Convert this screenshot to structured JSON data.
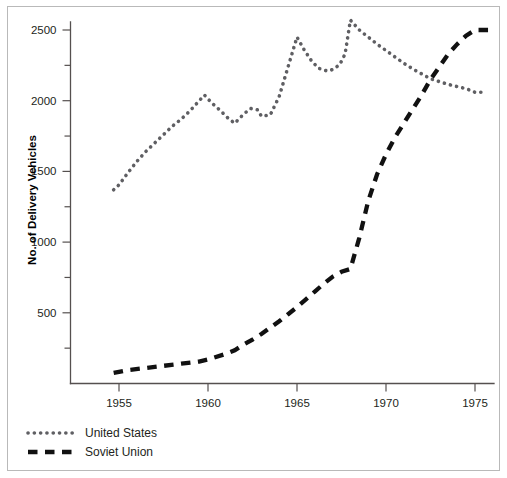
{
  "chart_data": {
    "type": "line",
    "title": "",
    "xlabel": "",
    "ylabel": "No. of Delivery Vehicles",
    "xlim": [
      1954.2,
      1976.3
    ],
    "ylim": [
      0,
      2600
    ],
    "grid": false,
    "legend_position": "bottom-left",
    "x_ticks": [
      1955,
      1960,
      1965,
      1970,
      1975
    ],
    "x_tick_labels": [
      "1955",
      "1960",
      "1965",
      "1970",
      "1975"
    ],
    "y_ticks": [
      500,
      1000,
      1500,
      2000,
      2500
    ],
    "y_tick_labels": [
      "500",
      "1000",
      "1500",
      "2000",
      "2500"
    ],
    "y_minor_ticks": [
      250,
      750,
      1250,
      1750,
      2250
    ],
    "series": [
      {
        "name": "United States",
        "style": "dotted",
        "color": "#5f5f63",
        "x": [
          1954.7,
          1955.0,
          1955.5,
          1956.0,
          1956.5,
          1957.0,
          1957.5,
          1958.0,
          1958.5,
          1959.0,
          1959.4,
          1959.8,
          1960.2,
          1960.7,
          1961.1,
          1961.5,
          1962.0,
          1962.4,
          1962.8,
          1963.0,
          1963.5,
          1964.0,
          1964.5,
          1965.0,
          1965.4,
          1965.8,
          1966.2,
          1966.7,
          1967.0,
          1967.4,
          1967.7,
          1968.0,
          1968.5,
          1969.0,
          1969.5,
          1970.0,
          1970.5,
          1971.0,
          1971.5,
          1972.0,
          1972.5,
          1973.0,
          1973.5,
          1974.0,
          1974.5,
          1975.0,
          1975.5
        ],
        "y": [
          1370,
          1405,
          1490,
          1570,
          1640,
          1700,
          1760,
          1820,
          1870,
          1930,
          1985,
          2040,
          1985,
          1930,
          1880,
          1840,
          1905,
          1945,
          1935,
          1890,
          1900,
          2030,
          2240,
          2450,
          2360,
          2285,
          2230,
          2210,
          2220,
          2255,
          2330,
          2570,
          2500,
          2450,
          2400,
          2355,
          2310,
          2265,
          2225,
          2190,
          2155,
          2135,
          2115,
          2100,
          2085,
          2060,
          2060
        ]
      },
      {
        "name": "Soviet Union",
        "style": "dashed",
        "color": "#111111",
        "x": [
          1954.7,
          1955.5,
          1956.5,
          1957.5,
          1958.5,
          1959.5,
          1960.0,
          1961.0,
          1961.5,
          1962.0,
          1962.5,
          1963.0,
          1963.5,
          1964.0,
          1964.5,
          1965.0,
          1965.5,
          1966.0,
          1966.5,
          1967.0,
          1967.5,
          1968.0,
          1968.5,
          1969.0,
          1969.5,
          1970.0,
          1970.5,
          1971.0,
          1971.5,
          1972.0,
          1972.5,
          1973.0,
          1973.5,
          1974.0,
          1974.5,
          1975.0,
          1976.0
        ],
        "y": [
          75,
          95,
          110,
          125,
          140,
          155,
          170,
          210,
          235,
          275,
          310,
          350,
          395,
          440,
          490,
          540,
          595,
          650,
          705,
          755,
          790,
          810,
          1030,
          1290,
          1480,
          1620,
          1740,
          1840,
          1940,
          2040,
          2150,
          2240,
          2330,
          2400,
          2460,
          2500,
          2500
        ]
      }
    ]
  },
  "legend": {
    "items": [
      {
        "label": "United States",
        "style": "dotted",
        "color": "#5f5f63"
      },
      {
        "label": "Soviet Union",
        "style": "dashed",
        "color": "#111111"
      }
    ]
  },
  "colors": {
    "united_states": "#5f5f63",
    "soviet_union": "#111111",
    "axis": "#55504f",
    "border": "#b9b9b9",
    "background": "#ffffff"
  }
}
